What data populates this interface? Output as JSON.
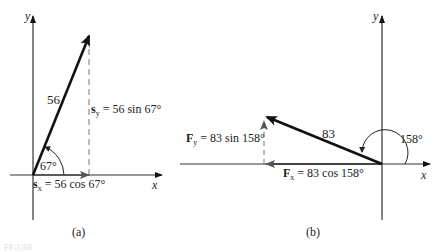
{
  "figure_label": "FIGURE",
  "panel_a": {
    "caption": "(a)",
    "x_axis_label": "x",
    "y_axis_label": "y",
    "magnitude_label": "56",
    "angle_label": "67°",
    "sx_symbol": "s",
    "sx_subscript": "x",
    "sx_expr": " = 56 cos 67°",
    "sy_symbol": "s",
    "sy_subscript": "y",
    "sy_expr": " = 56 sin 67°"
  },
  "panel_b": {
    "caption": "(b)",
    "x_axis_label": "x",
    "y_axis_label": "y",
    "magnitude_label": "83",
    "angle_label": "158°",
    "fx_symbol": "F",
    "fx_subscript": "x",
    "fx_expr": " = 83 cos 158°",
    "fy_symbol": "F",
    "fy_subscript": "y",
    "fy_expr": " = 83 sin 158°"
  },
  "colors": {
    "ink": "#222222",
    "vector": "#111111",
    "component": "#555555",
    "dash": "#777777"
  }
}
